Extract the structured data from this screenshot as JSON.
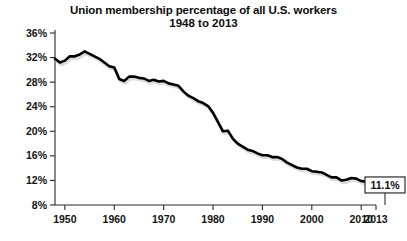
{
  "chart_data": {
    "type": "line",
    "title": "Union membership percentage of all U.S. workers",
    "subtitle": "1948 to 2013",
    "xlabel": "",
    "ylabel": "",
    "grid": false,
    "legend": "none",
    "xlim": [
      1948,
      2013
    ],
    "ylim": [
      8,
      36
    ],
    "ytick_labels": [
      "36%",
      "32%",
      "28%",
      "24%",
      "20%",
      "16%",
      "12%",
      "8%"
    ],
    "ytick_values": [
      36,
      32,
      28,
      24,
      20,
      16,
      12,
      8
    ],
    "xtick_labels": [
      "1950",
      "1960",
      "1970",
      "1980",
      "1990",
      "2000",
      "2010",
      "2013"
    ],
    "xtick_values": [
      1950,
      1960,
      1970,
      1980,
      1990,
      2000,
      2010,
      2013
    ],
    "annotations": [
      {
        "label": "11.1%",
        "x": 2013,
        "y": 11.1
      }
    ],
    "series": [
      {
        "name": "Union membership percentage",
        "x": [
          1948,
          1949,
          1950,
          1951,
          1952,
          1953,
          1954,
          1955,
          1956,
          1957,
          1958,
          1959,
          1960,
          1961,
          1962,
          1963,
          1964,
          1965,
          1966,
          1967,
          1968,
          1969,
          1970,
          1971,
          1972,
          1973,
          1974,
          1975,
          1976,
          1977,
          1978,
          1979,
          1980,
          1981,
          1982,
          1983,
          1984,
          1985,
          1986,
          1987,
          1988,
          1989,
          1990,
          1991,
          1992,
          1993,
          1994,
          1995,
          1996,
          1997,
          1998,
          1999,
          2000,
          2001,
          2002,
          2003,
          2004,
          2005,
          2006,
          2007,
          2008,
          2009,
          2010,
          2011,
          2012,
          2013
        ],
        "values": [
          31.8,
          31.2,
          31.5,
          32.2,
          32.2,
          32.5,
          33.0,
          32.6,
          32.2,
          31.8,
          31.2,
          30.6,
          30.4,
          28.5,
          28.2,
          28.9,
          28.9,
          28.7,
          28.6,
          28.2,
          28.4,
          28.1,
          28.2,
          27.8,
          27.6,
          27.4,
          26.5,
          25.8,
          25.4,
          24.9,
          24.6,
          24.1,
          23.0,
          21.5,
          20.0,
          20.1,
          18.8,
          18.0,
          17.5,
          17.0,
          16.8,
          16.4,
          16.1,
          16.1,
          15.8,
          15.8,
          15.5,
          14.9,
          14.5,
          14.1,
          13.9,
          13.9,
          13.5,
          13.4,
          13.3,
          12.9,
          12.5,
          12.5,
          12.0,
          12.1,
          12.4,
          12.3,
          11.9,
          11.8,
          11.3,
          11.1
        ]
      }
    ]
  },
  "callout": {
    "value": "11.1%"
  }
}
